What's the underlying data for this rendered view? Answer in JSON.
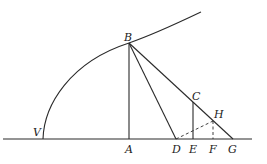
{
  "diagram": {
    "type": "geometric-figure",
    "points": {
      "V": {
        "label": "V"
      },
      "B": {
        "label": "B"
      },
      "A": {
        "label": "A"
      },
      "D": {
        "label": "D"
      },
      "E": {
        "label": "E"
      },
      "F": {
        "label": "F"
      },
      "G": {
        "label": "G"
      },
      "C": {
        "label": "C"
      },
      "H": {
        "label": "H"
      }
    },
    "segments": [
      {
        "from": "B",
        "to": "A",
        "style": "solid"
      },
      {
        "from": "B",
        "to": "D",
        "style": "solid"
      },
      {
        "from": "B",
        "to": "G",
        "style": "solid"
      },
      {
        "from": "C",
        "to": "E",
        "style": "solid"
      },
      {
        "from": "D",
        "to": "H",
        "style": "dashed"
      },
      {
        "from": "H",
        "to": "F",
        "style": "dashed"
      }
    ],
    "curves": [
      {
        "name": "parabola",
        "vertex": "V",
        "through": "B"
      }
    ],
    "axis_line": "horizontal baseline through V, A, D, E, F, G"
  }
}
